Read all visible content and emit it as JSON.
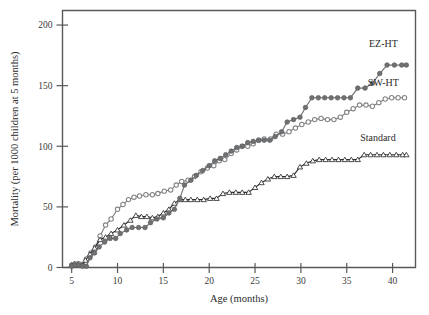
{
  "figure": {
    "background_color": "#ffffff",
    "frame_color": "#59595b"
  },
  "chart_data": {
    "type": "line",
    "title": "",
    "subtitle": "",
    "xlabel": "Age (months)",
    "ylabel": "Mortality (per 1000 children at 5 months)",
    "xlim": [
      4,
      42.5
    ],
    "ylim": [
      0,
      212
    ],
    "xticks": [
      5,
      10,
      15,
      20,
      25,
      30,
      35,
      40
    ],
    "yticks": [
      0,
      50,
      100,
      150,
      200
    ],
    "xtick_labels": [
      "5",
      "10",
      "15",
      "20",
      "25",
      "30",
      "35",
      "40"
    ],
    "ytick_labels": [
      "0",
      "50",
      "100",
      "150",
      "200"
    ],
    "grid": false,
    "legend_position": "inline-right-end-of-line",
    "series": [
      {
        "name": "EZ-HT",
        "label": "EZ-HT",
        "color": "#6f7072",
        "marker": "filled-circle",
        "marker_size": 4.6,
        "label_x": 39.0,
        "label_y": 182,
        "x": [
          5.0,
          5.4,
          5.8,
          6.2,
          6.6,
          7.0,
          7.5,
          8.0,
          8.6,
          9.2,
          9.8,
          10.3,
          11.0,
          11.6,
          12.3,
          13.0,
          13.6,
          14.3,
          15.0,
          15.6,
          16.2,
          16.8,
          17.3,
          18.0,
          18.6,
          19.3,
          20.0,
          20.6,
          21.2,
          21.8,
          22.4,
          23.0,
          23.6,
          24.2,
          24.8,
          25.4,
          26.0,
          26.6,
          27.2,
          27.9,
          28.5,
          29.2,
          29.9,
          30.5,
          31.2,
          31.9,
          32.6,
          33.3,
          34.0,
          34.7,
          35.4,
          36.2,
          37.0,
          37.8,
          38.6,
          39.4,
          40.2,
          41.0,
          41.5
        ],
        "y": [
          1,
          2,
          2,
          1,
          1,
          8,
          12,
          17,
          21,
          24,
          24,
          28,
          31,
          33,
          33,
          33,
          37,
          40,
          41,
          45,
          48,
          57,
          68,
          72,
          76,
          80,
          84,
          88,
          90,
          93,
          96,
          99,
          100,
          103,
          104,
          105,
          105,
          105,
          108,
          112,
          120,
          122,
          124,
          132,
          140,
          140,
          140,
          140,
          140,
          140,
          140,
          148,
          148,
          152,
          160,
          167,
          167,
          167,
          167
        ]
      },
      {
        "name": "SW-HT",
        "label": "SW-HT",
        "color": "#828386",
        "marker": "open-circle",
        "marker_size": 4.4,
        "label_x": 39.0,
        "label_y": 150,
        "x": [
          5.0,
          5.4,
          5.8,
          6.2,
          6.6,
          7.1,
          7.6,
          8.1,
          8.7,
          9.3,
          10.0,
          10.6,
          11.2,
          11.8,
          12.4,
          13.1,
          13.8,
          14.4,
          15.1,
          15.8,
          16.4,
          17.0,
          17.7,
          18.4,
          19.1,
          19.8,
          20.5,
          21.1,
          21.7,
          22.4,
          23.0,
          23.6,
          24.2,
          24.8,
          25.4,
          26.0,
          26.7,
          27.3,
          28.0,
          28.7,
          29.4,
          30.1,
          30.8,
          31.5,
          32.2,
          32.9,
          33.6,
          34.3,
          35.0,
          35.7,
          36.4,
          37.1,
          37.8,
          38.5,
          39.2,
          39.9,
          40.6,
          41.3
        ],
        "y": [
          2,
          3,
          3,
          2,
          7,
          12,
          17,
          26,
          35,
          40,
          48,
          52,
          56,
          58,
          59,
          60,
          60,
          61,
          63,
          64,
          68,
          71,
          72,
          75,
          79,
          82,
          84,
          88,
          89,
          94,
          97,
          100,
          100,
          102,
          105,
          106,
          106,
          110,
          110,
          112,
          115,
          118,
          120,
          122,
          123,
          122,
          122,
          124,
          128,
          131,
          134,
          134,
          133,
          136,
          139,
          140,
          140,
          140
        ]
      },
      {
        "name": "Standard",
        "label": "Standard",
        "color": "#2d2d2f",
        "marker": "open-triangle",
        "marker_size": 4.0,
        "label_x": 38.4,
        "label_y": 104,
        "x": [
          5.0,
          5.3,
          5.7,
          6.1,
          6.5,
          7.0,
          7.5,
          8.1,
          8.7,
          9.3,
          10.0,
          10.7,
          11.4,
          12.0,
          12.6,
          13.2,
          13.8,
          14.4,
          15.0,
          15.6,
          16.2,
          16.8,
          17.4,
          18.0,
          18.7,
          19.4,
          20.1,
          20.8,
          21.5,
          22.2,
          22.9,
          23.6,
          24.3,
          25.0,
          25.7,
          26.4,
          27.1,
          27.8,
          28.5,
          29.2,
          29.9,
          30.6,
          31.3,
          32.0,
          32.7,
          33.4,
          34.1,
          34.8,
          35.5,
          36.2,
          36.9,
          37.6,
          38.3,
          39.0,
          39.7,
          40.4,
          41.1,
          41.5
        ],
        "y": [
          2,
          3,
          3,
          2,
          6,
          11,
          16,
          23,
          25,
          28,
          31,
          35,
          39,
          43,
          42,
          42,
          41,
          42,
          45,
          48,
          53,
          56,
          56,
          56,
          56,
          56,
          57,
          57,
          61,
          62,
          62,
          62,
          62,
          66,
          70,
          73,
          75,
          75,
          75,
          76,
          83,
          86,
          88,
          89,
          89,
          89,
          89,
          89,
          89,
          89,
          93,
          93,
          93,
          93,
          93,
          93,
          93,
          93
        ]
      }
    ]
  }
}
